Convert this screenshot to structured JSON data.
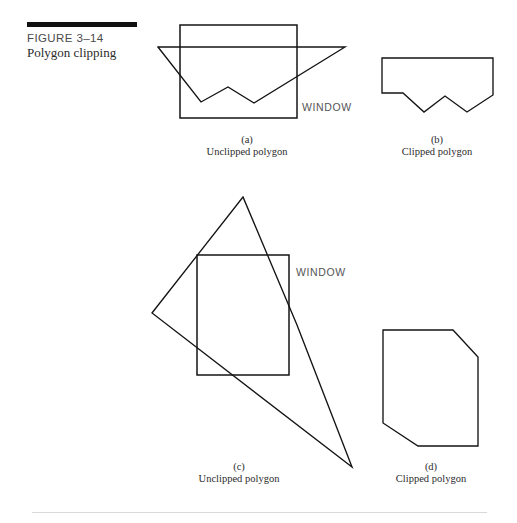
{
  "figure": {
    "number": "FIGURE 3–14",
    "title": "Polygon clipping",
    "rule_color": "#111111"
  },
  "labels": {
    "window_a": "WINDOW",
    "window_c": "WINDOW",
    "panel_a_letter": "(a)",
    "panel_a_name": "Unclipped polygon",
    "panel_b_letter": "(b)",
    "panel_b_name": "Clipped polygon",
    "panel_c_letter": "(c)",
    "panel_c_name": "Unclipped polygon",
    "panel_d_letter": "(d)",
    "panel_d_name": "Clipped polygon"
  },
  "geometry": {
    "stroke_color": "#141414",
    "panel_a": {
      "window_rect": {
        "x": 180,
        "y": 25,
        "width": 117,
        "height": 93
      },
      "polygon_points": "158,47 201,102 228,87 254,103 345,47 158,47"
    },
    "panel_b": {
      "polygon_points": "382,58 493,58 493,95 467,112 445,96 424,112 403,93 382,93 382,58"
    },
    "panel_c": {
      "window_rect": {
        "x": 197,
        "y": 255,
        "width": 92,
        "height": 120
      },
      "polygon_points": "243,197 152,313 352,467 297,325 243,197"
    },
    "panel_d": {
      "polygon_points": "383,330 453,330 478,357 478,446 418,446 383,423 383,330"
    }
  }
}
